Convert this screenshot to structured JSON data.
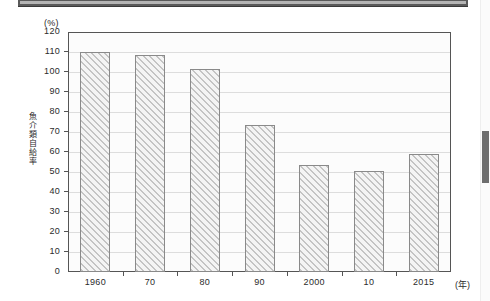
{
  "artifacts": {
    "top_rule_name": "page-top-rule",
    "scrollbar_name": "vertical-scrollbar"
  },
  "chart_data": {
    "type": "bar",
    "title": "",
    "subtitle": "",
    "xlabel": "(年)",
    "ylabel": "魚介類自給率",
    "y_unit": "(%)",
    "categories": [
      "1960",
      "70",
      "80",
      "90",
      "2000",
      "10",
      "2015"
    ],
    "values": [
      110,
      108.5,
      101.5,
      73.5,
      53.5,
      50.3,
      59
    ],
    "ylim": [
      0,
      120
    ],
    "ytick_labels": [
      "120",
      "110",
      "100",
      "90",
      "80",
      "70",
      "60",
      "50",
      "40",
      "30",
      "20",
      "10",
      "0"
    ],
    "ytick_values": [
      120,
      110,
      100,
      90,
      80,
      70,
      60,
      50,
      40,
      30,
      20,
      10,
      0
    ],
    "grid": true,
    "grid_axis": "y",
    "legend": "none",
    "series": [
      {
        "name": "魚介類自給率",
        "values": [
          110,
          108.5,
          101.5,
          73.5,
          53.5,
          50.3,
          59
        ]
      }
    ]
  },
  "colors": {
    "bar_fill": "#efefef",
    "bar_hatch": "#c4c4c4",
    "bar_border": "#8a8a8a",
    "axis": "#555555",
    "grid": "#dddddd",
    "plot_background": "#fcfcfc",
    "page_background": "#ffffff",
    "scrollbar_thumb": "#6e6e6e"
  }
}
